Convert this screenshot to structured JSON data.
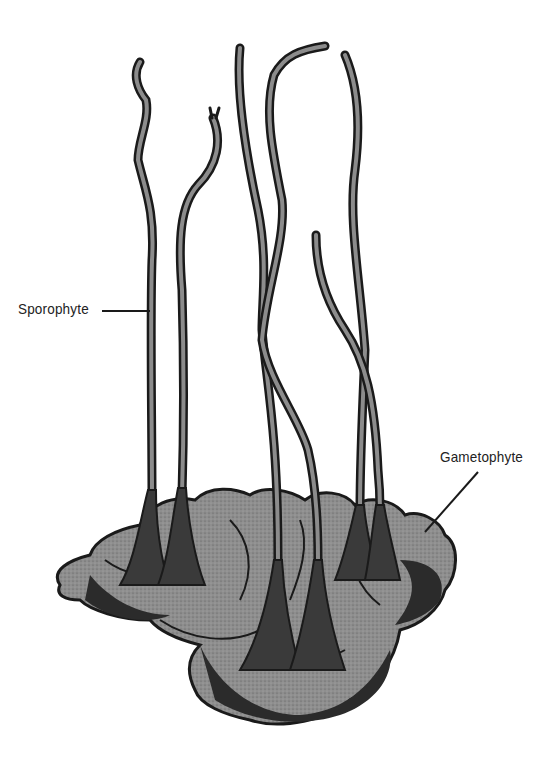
{
  "figure": {
    "labels": [
      {
        "text": "Sporophyte",
        "target": "sporophyte stalk"
      },
      {
        "text": "Gametophyte",
        "target": "gametophyte thallus"
      }
    ]
  },
  "colors": {
    "ink": "#1a1a1a",
    "fill_gray": "#8c8c8c",
    "background": "#ffffff"
  }
}
